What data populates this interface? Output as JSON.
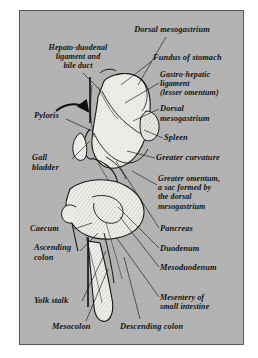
{
  "plate": {
    "kind": "anatomical-line-drawing",
    "subject": "Developing digestive tract, mesenteries and omenta",
    "background_color": "#b4b4b4",
    "ink_color": "#121212",
    "organ_fill_color": "#f2f0ea",
    "border_color": "#55595c",
    "paper_color": "#ffffff"
  },
  "labels": [
    {
      "id": "dorsal-mesogastrium-top",
      "text": "Dorsal mesogastrium",
      "align": "center",
      "x": 92,
      "y": 14,
      "w": 120
    },
    {
      "id": "hepato-duodenal",
      "text": "Hepato-duodenal\nligament and\nbile duct",
      "align": "center",
      "x": 6,
      "y": 32,
      "w": 104
    },
    {
      "id": "fundus-of-stomach",
      "text": "Fundus of stomach",
      "align": "left",
      "x": 133,
      "y": 42,
      "w": 92
    },
    {
      "id": "gastro-hepatic",
      "text": "Gastro-hepatic\nligament\n(lesser omentum)",
      "align": "left",
      "x": 140,
      "y": 59,
      "w": 86
    },
    {
      "id": "dorsal-mesogastrium-2",
      "text": "Dorsal\nmesogastrium",
      "align": "left",
      "x": 140,
      "y": 93,
      "w": 80
    },
    {
      "id": "pyloris",
      "text": "Pyloris",
      "align": "left",
      "x": 14,
      "y": 100,
      "w": 56
    },
    {
      "id": "spleen",
      "text": "Spleen",
      "align": "left",
      "x": 144,
      "y": 122,
      "w": 56
    },
    {
      "id": "gall-bladder",
      "text": "Gall\nbladder",
      "align": "left",
      "x": 12,
      "y": 142,
      "w": 56
    },
    {
      "id": "greater-curvature",
      "text": "Greater curvature",
      "align": "left",
      "x": 136,
      "y": 142,
      "w": 88
    },
    {
      "id": "greater-omentum",
      "text": "Greater omentum,\na sac formed by\nthe dorsal\nmesogastrium",
      "align": "left",
      "x": 138,
      "y": 163,
      "w": 90
    },
    {
      "id": "caecum",
      "text": "Caecum",
      "align": "left",
      "x": 10,
      "y": 213,
      "w": 58
    },
    {
      "id": "pancreas",
      "text": "Pancreas",
      "align": "left",
      "x": 140,
      "y": 213,
      "w": 62
    },
    {
      "id": "ascending-colon",
      "text": "Ascending\ncolon",
      "align": "left",
      "x": 14,
      "y": 232,
      "w": 64
    },
    {
      "id": "duodenum",
      "text": "Duodenum",
      "align": "left",
      "x": 140,
      "y": 233,
      "w": 66
    },
    {
      "id": "mesoduodenum",
      "text": "Mesoduodenum",
      "align": "left",
      "x": 140,
      "y": 252,
      "w": 80
    },
    {
      "id": "yolk-stalk",
      "text": "Yolk stalk",
      "align": "left",
      "x": 14,
      "y": 285,
      "w": 62
    },
    {
      "id": "mesentery-small-intestine",
      "text": "Mesentery of\nsmall intestine",
      "align": "left",
      "x": 140,
      "y": 282,
      "w": 84
    },
    {
      "id": "mesocolon",
      "text": "Mesocolon",
      "align": "left",
      "x": 32,
      "y": 311,
      "w": 68
    },
    {
      "id": "descending-colon",
      "text": "Descending colon",
      "align": "left",
      "x": 100,
      "y": 311,
      "w": 92
    }
  ],
  "leader_lines": [
    {
      "id": "leader-dorsal-mesogastrium-top",
      "points": "146,26 118,74"
    },
    {
      "id": "leader-hepato-duodenal",
      "points": "63,62 81,80"
    },
    {
      "id": "leader-fundus",
      "points": "132,50 101,74"
    },
    {
      "id": "leader-gastro-hepatic",
      "points": "139,72 105,92"
    },
    {
      "id": "leader-dorsal-mesogastrium-2",
      "points": "139,98 113,110"
    },
    {
      "id": "leader-pyloris",
      "points": "46,108 72,120"
    },
    {
      "id": "leader-spleen",
      "points": "143,127 124,119"
    },
    {
      "id": "leader-gall-bladder",
      "points": "52,148 70,130"
    },
    {
      "id": "leader-greater-curvature",
      "points": "135,147 107,140"
    },
    {
      "id": "leader-greater-omentum",
      "points": "137,174 112,160"
    },
    {
      "id": "leader-caecum",
      "points": "54,218 72,212"
    },
    {
      "id": "leader-pancreas",
      "points": "139,217 96,150"
    },
    {
      "id": "leader-ascending-colon",
      "points": "60,240 78,222"
    },
    {
      "id": "leader-duodenum",
      "points": "139,237 98,196"
    },
    {
      "id": "leader-mesoduodenum",
      "points": "139,256 100,206"
    },
    {
      "id": "leader-yolk-stalk",
      "points": "62,290 86,240"
    },
    {
      "id": "leader-mesentery",
      "points": "139,286 96,226"
    },
    {
      "id": "leader-mesocolon",
      "points": "66,310 88,258"
    },
    {
      "id": "leader-descending-colon",
      "points": "120,308 104,246"
    }
  ],
  "arrow": {
    "id": "omental-bursa-arrow",
    "description": "curved arrow entering the lesser sac"
  }
}
